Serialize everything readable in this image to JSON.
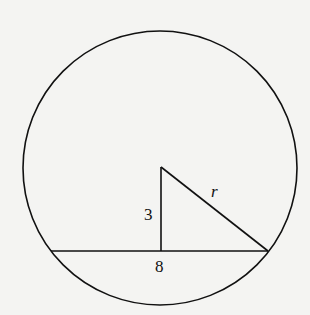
{
  "diagram": {
    "type": "geometry",
    "labels": {
      "vertical_segment": "3",
      "hypotenuse": "r",
      "chord": "8"
    },
    "colors": {
      "stroke": "#111111",
      "background": "#f4f4f2"
    }
  }
}
